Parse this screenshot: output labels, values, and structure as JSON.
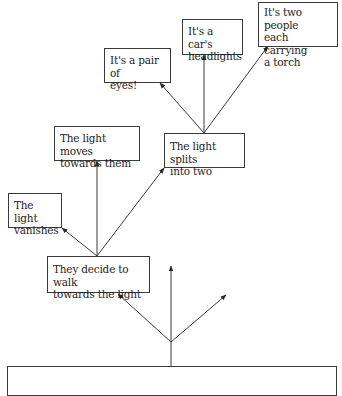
{
  "diagram": {
    "type": "decision-tree",
    "stroke_color": "#3a3a3a",
    "text_color": "#1e1e1e",
    "nodes": {
      "root": {
        "label": ""
      },
      "walk": {
        "label": "They decide to walk\ntowards the light"
      },
      "vanishes": {
        "label": "The light\nvanishes"
      },
      "moves": {
        "label": "The light moves\ntowards them"
      },
      "splits": {
        "label": "The light splits\ninto two"
      },
      "eyes": {
        "label": "It's a pair of\neyes!"
      },
      "headlights": {
        "label": "It's a car's\nheadlights"
      },
      "two_people": {
        "label": "It's two people\neach carrying\na torch"
      }
    },
    "edges": [
      {
        "from": "root",
        "to": "walk"
      },
      {
        "from": "root",
        "to": "unlabeled-up"
      },
      {
        "from": "root",
        "to": "unlabeled-right"
      },
      {
        "from": "walk",
        "to": "vanishes"
      },
      {
        "from": "walk",
        "to": "moves"
      },
      {
        "from": "walk",
        "to": "splits"
      },
      {
        "from": "splits",
        "to": "eyes"
      },
      {
        "from": "splits",
        "to": "headlights"
      },
      {
        "from": "splits",
        "to": "two_people"
      }
    ]
  }
}
